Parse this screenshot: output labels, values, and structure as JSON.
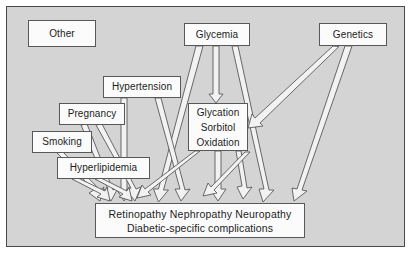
{
  "figure": {
    "background_color": "#d4d4d4",
    "frame_border_color": "#4a4a4a",
    "node_fill_color": "#fbfbfb",
    "node_border_color": "#585858",
    "arrow_fill_color": "#f2f2f2",
    "arrow_outline_color": "#595959"
  },
  "nodes": {
    "other": {
      "label": "Other"
    },
    "glycemia": {
      "label": "Glycemia"
    },
    "genetics": {
      "label": "Genetics"
    },
    "hypertension": {
      "label": "Hypertension"
    },
    "pregnancy": {
      "label": "Pregnancy"
    },
    "smoking": {
      "label": "Smoking"
    },
    "metabolic": {
      "line1": "Glycation",
      "line2": "Sorbitol",
      "line3": "Oxidation"
    },
    "hyperlipidemia": {
      "label": "Hyperlipidemia"
    },
    "outcome": {
      "line1": "Retinopathy  Nephropathy  Neuropathy",
      "line2": "Diabetic-specific complications"
    }
  },
  "edges": [
    {
      "from": "glycemia",
      "to": "outcome"
    },
    {
      "from": "glycemia",
      "to": "metabolic"
    },
    {
      "from": "glycemia",
      "to": "outcome"
    },
    {
      "from": "genetics",
      "to": "metabolic"
    },
    {
      "from": "genetics",
      "to": "outcome"
    },
    {
      "from": "hypertension",
      "to": "outcome"
    },
    {
      "from": "hypertension",
      "to": "outcome"
    },
    {
      "from": "pregnancy",
      "to": "outcome"
    },
    {
      "from": "pregnancy",
      "to": "outcome"
    },
    {
      "from": "smoking",
      "to": "outcome"
    },
    {
      "from": "hyperlipidemia",
      "to": "outcome"
    },
    {
      "from": "hyperlipidemia",
      "to": "outcome"
    },
    {
      "from": "metabolic",
      "to": "outcome"
    },
    {
      "from": "metabolic",
      "to": "outcome"
    },
    {
      "from": "metabolic",
      "to": "outcome"
    }
  ]
}
